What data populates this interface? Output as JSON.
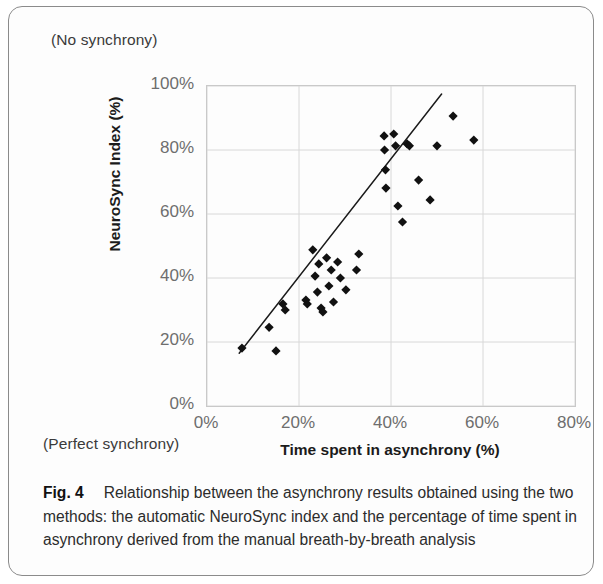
{
  "figure": {
    "label": "Fig. 4",
    "caption": "Relationship between the asynchrony results obtained using the two methods: the automatic NeuroSync index and the percentage of time spent in asynchrony derived from the manual breath-by-breath analysis",
    "top_left_note": "(No synchrony)",
    "bottom_left_note": "(Perfect synchrony)"
  },
  "chart_data": {
    "type": "scatter",
    "title": "",
    "xlabel": "Time spent in asynchrony (%)",
    "ylabel": "NeuroSync Index (%)",
    "xlim": [
      0,
      80
    ],
    "ylim": [
      0,
      100
    ],
    "xticks": [
      0,
      20,
      40,
      60,
      80
    ],
    "yticks": [
      0,
      20,
      40,
      60,
      80,
      100
    ],
    "xtick_labels": [
      "0%",
      "20%",
      "40%",
      "60%",
      "80%"
    ],
    "ytick_labels": [
      "0%",
      "20%",
      "40%",
      "60%",
      "80%",
      "100%"
    ],
    "grid": true,
    "legend": false,
    "marker": "diamond",
    "marker_color": "#111111",
    "marker_size": 6,
    "points": [
      [
        7.6,
        18.1
      ],
      [
        13.5,
        24.6
      ],
      [
        15.0,
        17.2
      ],
      [
        16.5,
        31.9
      ],
      [
        17.0,
        30.0
      ],
      [
        21.5,
        33.1
      ],
      [
        21.8,
        31.9
      ],
      [
        23.0,
        48.8
      ],
      [
        23.5,
        40.6
      ],
      [
        24.0,
        35.6
      ],
      [
        24.3,
        44.4
      ],
      [
        24.8,
        30.6
      ],
      [
        25.2,
        29.4
      ],
      [
        26.0,
        46.3
      ],
      [
        26.5,
        37.5
      ],
      [
        27.0,
        42.5
      ],
      [
        27.5,
        32.5
      ],
      [
        28.4,
        45.0
      ],
      [
        29.0,
        40.0
      ],
      [
        30.2,
        36.3
      ],
      [
        32.5,
        42.5
      ],
      [
        33.0,
        47.5
      ],
      [
        38.5,
        84.4
      ],
      [
        38.6,
        80.0
      ],
      [
        38.8,
        73.8
      ],
      [
        38.9,
        68.1
      ],
      [
        40.6,
        85.0
      ],
      [
        41.0,
        81.3
      ],
      [
        41.5,
        62.5
      ],
      [
        42.5,
        57.5
      ],
      [
        43.5,
        81.9
      ],
      [
        44.0,
        81.3
      ],
      [
        46.0,
        70.6
      ],
      [
        48.5,
        64.4
      ],
      [
        50.0,
        81.3
      ],
      [
        53.5,
        90.6
      ],
      [
        58.0,
        83.1
      ]
    ],
    "trendline": {
      "x_start": 7.0,
      "y_start": 16.5,
      "x_end": 51.0,
      "y_end": 97.5,
      "color": "#1b1b1b",
      "width": 1.5
    }
  },
  "colors": {
    "grid": "#d8d8d8",
    "frame": "#c9c9c9",
    "tick_text": "#6e6e6e",
    "axis_title": "#1b1b1b",
    "card_border": "#8b8b8b"
  }
}
